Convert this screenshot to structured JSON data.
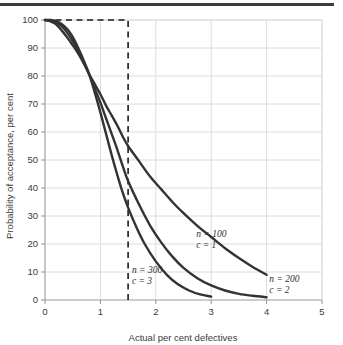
{
  "figure": {
    "top_rule_color": "#3c3c3c",
    "background_color": "#ffffff",
    "grid_color": "#dcdcdc",
    "axis_color": "#9a9a9a",
    "curve_color": "#333333",
    "dashed_color": "#1a1a1a"
  },
  "chart_data": {
    "type": "line",
    "title": "",
    "subtitle": "",
    "xlabel": "Actual per cent defectives",
    "ylabel": "Probability of acceptance, per cent",
    "xlim": [
      0,
      5
    ],
    "ylim": [
      0,
      100
    ],
    "xticks": [
      0,
      1,
      2,
      3,
      4,
      5
    ],
    "xtick_labels": [
      "0",
      "1",
      "2",
      "3",
      "4",
      "5"
    ],
    "yticks": [
      0,
      10,
      20,
      30,
      40,
      50,
      60,
      70,
      80,
      90,
      100
    ],
    "ytick_labels": [
      "0",
      "10",
      "20",
      "30",
      "40",
      "50",
      "60",
      "70",
      "80",
      "90",
      "100"
    ],
    "grid": true,
    "legend": "inline-annotations",
    "series": [
      {
        "name": "n = 100, c = 1",
        "label_line1": "n = 100",
        "label_line2": "c = 1",
        "label_x": 2.73,
        "label_y": 22.5,
        "x": [
          0.0,
          0.1,
          0.2,
          0.3,
          0.4,
          0.5,
          0.6,
          0.7,
          0.8,
          0.9,
          1.0,
          1.1,
          1.2,
          1.3,
          1.4,
          1.5,
          1.7,
          1.9,
          2.1,
          2.3,
          2.5,
          2.75,
          3.0,
          3.25,
          3.5,
          3.75,
          4.0
        ],
        "y": [
          100.0,
          99.5,
          98.5,
          96.3,
          93.8,
          91.0,
          88.0,
          84.5,
          80.5,
          77.0,
          73.5,
          69.5,
          66.0,
          62.5,
          58.5,
          55.0,
          49.5,
          44.0,
          39.5,
          35.0,
          31.0,
          26.5,
          22.5,
          18.5,
          15.0,
          11.8,
          9.0
        ]
      },
      {
        "name": "n = 200, c = 2",
        "label_line1": "n = 200",
        "label_line2": "c = 2",
        "label_x": 4.05,
        "label_y": 6.5,
        "x": [
          0.0,
          0.1,
          0.2,
          0.3,
          0.4,
          0.5,
          0.6,
          0.7,
          0.8,
          0.9,
          1.0,
          1.1,
          1.2,
          1.3,
          1.4,
          1.5,
          1.7,
          1.9,
          2.1,
          2.3,
          2.5,
          2.75,
          3.0,
          3.25,
          3.5,
          3.75,
          4.0
        ],
        "y": [
          100.0,
          99.8,
          99.2,
          97.8,
          95.5,
          92.5,
          89.0,
          85.0,
          80.5,
          75.5,
          70.5,
          65.0,
          59.5,
          54.0,
          48.0,
          42.5,
          34.0,
          26.5,
          20.5,
          15.5,
          11.5,
          7.8,
          5.2,
          3.4,
          2.2,
          1.5,
          1.0
        ]
      },
      {
        "name": "n = 300, c = 3",
        "label_line1": "n = 300",
        "label_line2": "c = 3",
        "label_x": 1.57,
        "label_y": 9.5,
        "x": [
          0.0,
          0.1,
          0.2,
          0.3,
          0.4,
          0.5,
          0.6,
          0.7,
          0.8,
          0.9,
          1.0,
          1.1,
          1.2,
          1.3,
          1.4,
          1.5,
          1.65,
          1.8,
          2.0,
          2.2,
          2.4,
          2.6,
          2.8,
          3.0
        ],
        "y": [
          100.0,
          100.0,
          99.6,
          98.6,
          96.8,
          94.0,
          90.0,
          85.5,
          80.5,
          74.0,
          67.0,
          59.5,
          52.0,
          45.0,
          38.5,
          33.0,
          26.0,
          20.0,
          13.8,
          9.0,
          5.6,
          3.4,
          2.0,
          1.2
        ]
      }
    ],
    "annotations": [
      {
        "name": "ideal-oc-curve",
        "style": "dashed",
        "x": [
          0.0,
          1.5,
          1.5
        ],
        "y": [
          100,
          100,
          0
        ]
      }
    ]
  }
}
